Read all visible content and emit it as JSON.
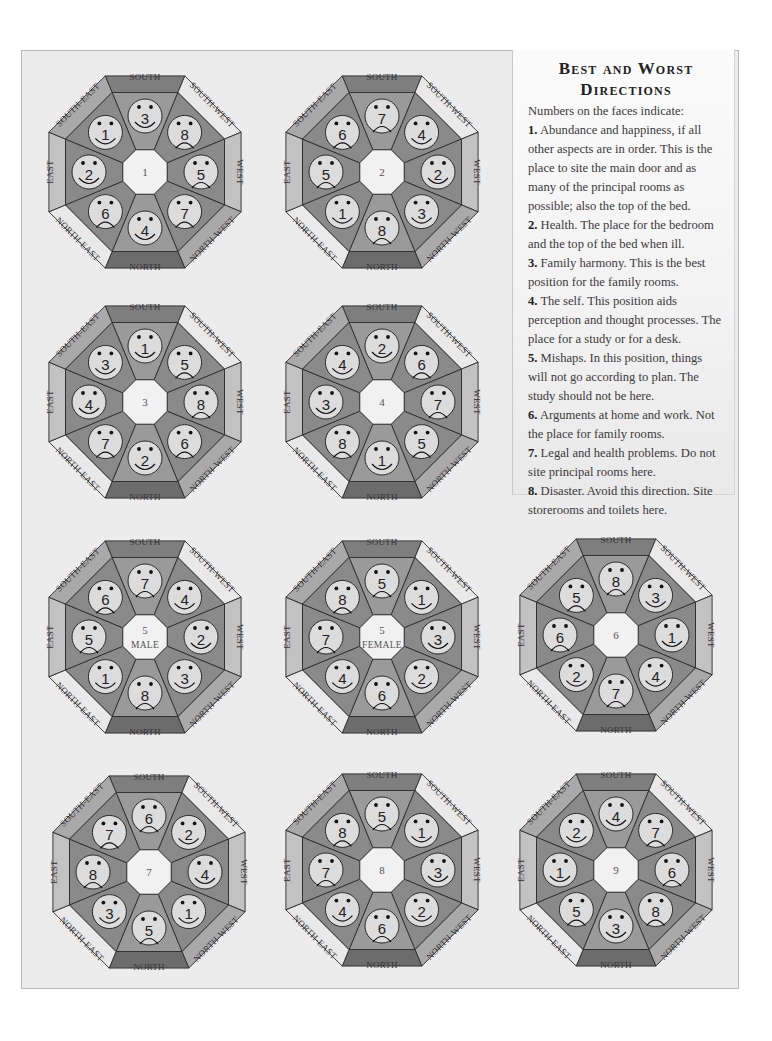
{
  "sidebar": {
    "title_line1": "Best and Worst",
    "title_line2": "Directions",
    "intro": "Numbers on the faces indicate:",
    "items": [
      {
        "num": "1.",
        "text": "Abundance and happiness, if all other aspects are in order. This is the place to site the main door and as many of the principal rooms as possible; also the top of the bed."
      },
      {
        "num": "2.",
        "text": "Health. The place for the bedroom and the top of the bed when ill."
      },
      {
        "num": "3.",
        "text": "Family harmony. This is the best position for the family rooms."
      },
      {
        "num": "4.",
        "text": "The self. This position aids perception and thought processes. The place for a study or for a desk."
      },
      {
        "num": "5.",
        "text": "Mishaps. In this position, things will not go according to plan. The study should not be here."
      },
      {
        "num": "6.",
        "text": "Arguments at home and work. Not the place for family rooms."
      },
      {
        "num": "7.",
        "text": "Legal and health problems. Do not site principal rooms here."
      },
      {
        "num": "8.",
        "text": "Disaster. Avoid this direction. Site storerooms and toilets here."
      }
    ]
  },
  "directions": {
    "south": "SOUTH",
    "south_west": "SOUTH-WEST",
    "west": "WEST",
    "north_west": "NORTH-WEST",
    "north": "NORTH",
    "north_east": "NORTH-EAST",
    "east": "EAST",
    "south_east": "SOUTH-EAST"
  },
  "colors": {
    "rim_south": "#7e7e7e",
    "rim_north": "#6c6c6c",
    "rim_diag_dark": "#a9a9a9",
    "rim_diag_light": "#e9e9e9",
    "rim_east_west": "#c2c2c2",
    "wedge_a": "#8a8a8a",
    "wedge_b": "#9a9a9a",
    "face": "#dcdcdc",
    "center": "#f1f1f1",
    "stroke": "#2b2b2b"
  },
  "chart_data": {
    "type": "diagram",
    "title": "Best and Worst Directions",
    "legend": {
      "1": "Abundance and happiness",
      "2": "Health",
      "3": "Family harmony",
      "4": "The self",
      "5": "Mishaps",
      "6": "Arguments",
      "7": "Legal and health problems",
      "8": "Disaster"
    },
    "happy_faces": [
      1,
      2,
      3,
      4
    ],
    "sad_faces": [
      5,
      6,
      7,
      8
    ],
    "charts": [
      {
        "id": "1",
        "center": [
          "1"
        ],
        "S": 3,
        "SW": 8,
        "W": 5,
        "NW": 7,
        "N": 4,
        "NE": 6,
        "E": 2,
        "SE": 1
      },
      {
        "id": "2",
        "center": [
          "2"
        ],
        "S": 7,
        "SW": 4,
        "W": 2,
        "NW": 3,
        "N": 8,
        "NE": 1,
        "E": 5,
        "SE": 6
      },
      {
        "id": "3",
        "center": [
          "3"
        ],
        "S": 1,
        "SW": 5,
        "W": 8,
        "NW": 6,
        "N": 2,
        "NE": 7,
        "E": 4,
        "SE": 3
      },
      {
        "id": "4",
        "center": [
          "4"
        ],
        "S": 2,
        "SW": 6,
        "W": 7,
        "NW": 5,
        "N": 1,
        "NE": 8,
        "E": 3,
        "SE": 4
      },
      {
        "id": "5m",
        "center": [
          "5",
          "MALE"
        ],
        "S": 7,
        "SW": 4,
        "W": 2,
        "NW": 3,
        "N": 8,
        "NE": 1,
        "E": 5,
        "SE": 6
      },
      {
        "id": "5f",
        "center": [
          "5",
          "FEMALE"
        ],
        "S": 5,
        "SW": 1,
        "W": 3,
        "NW": 2,
        "N": 6,
        "NE": 4,
        "E": 7,
        "SE": 8
      },
      {
        "id": "6",
        "center": [
          "6"
        ],
        "S": 8,
        "SW": 3,
        "W": 1,
        "NW": 4,
        "N": 7,
        "NE": 2,
        "E": 6,
        "SE": 5
      },
      {
        "id": "7",
        "center": [
          "7"
        ],
        "S": 6,
        "SW": 2,
        "W": 4,
        "NW": 1,
        "N": 5,
        "NE": 3,
        "E": 8,
        "SE": 7
      },
      {
        "id": "8",
        "center": [
          "8"
        ],
        "S": 5,
        "SW": 1,
        "W": 3,
        "NW": 2,
        "N": 6,
        "NE": 4,
        "E": 7,
        "SE": 8
      },
      {
        "id": "9",
        "center": [
          "9"
        ],
        "S": 4,
        "SW": 7,
        "W": 6,
        "NW": 8,
        "N": 3,
        "NE": 5,
        "E": 1,
        "SE": 2
      }
    ]
  },
  "layout": {
    "positions": [
      {
        "id": "1",
        "x": 38,
        "y": 65
      },
      {
        "id": "2",
        "x": 275,
        "y": 65
      },
      {
        "id": "3",
        "x": 38,
        "y": 295
      },
      {
        "id": "4",
        "x": 275,
        "y": 295
      },
      {
        "id": "5m",
        "x": 38,
        "y": 530
      },
      {
        "id": "5f",
        "x": 275,
        "y": 530
      },
      {
        "id": "6",
        "x": 509,
        "y": 528
      },
      {
        "id": "7",
        "x": 42,
        "y": 765
      },
      {
        "id": "8",
        "x": 275,
        "y": 763
      },
      {
        "id": "9",
        "x": 509,
        "y": 763
      }
    ]
  }
}
